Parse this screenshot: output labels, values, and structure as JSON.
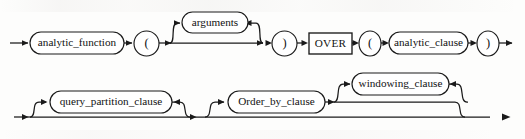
{
  "diagram": {
    "type": "railroad-syntax-diagram",
    "title": "analytic_function",
    "colors": {
      "background": "#fdfdfc",
      "stroke": "#1a1a1a",
      "node_fill": "#ffffff",
      "text": "#111111"
    },
    "rows": [
      {
        "id": "row-top",
        "nodes": [
          {
            "id": "analytic_function",
            "label": "analytic_function",
            "shape": "rounded-rect",
            "kind": "nonterminal",
            "x": 30,
            "y": 32,
            "w": 94,
            "h": 22
          },
          {
            "id": "open-paren-1",
            "label": "(",
            "shape": "circle",
            "kind": "terminal",
            "x": 134,
            "y": 31,
            "w": 25,
            "h": 25
          },
          {
            "id": "arguments",
            "label": "arguments",
            "shape": "rounded-rect",
            "kind": "nonterminal",
            "x": 182,
            "y": 12,
            "w": 66,
            "h": 21
          },
          {
            "id": "close-paren-1",
            "label": ")",
            "shape": "circle",
            "kind": "terminal",
            "x": 272,
            "y": 31,
            "w": 25,
            "h": 25
          },
          {
            "id": "over-keyword",
            "label": "OVER",
            "shape": "rect",
            "kind": "keyword",
            "x": 309,
            "y": 33,
            "w": 43,
            "h": 21
          },
          {
            "id": "open-paren-2",
            "label": "(",
            "shape": "circle",
            "kind": "terminal",
            "x": 359,
            "y": 31,
            "w": 22,
            "h": 25
          },
          {
            "id": "analytic_clause",
            "label": "analytic_clause",
            "shape": "rounded-rect",
            "kind": "nonterminal",
            "x": 389,
            "y": 32,
            "w": 79,
            "h": 22
          },
          {
            "id": "close-paren-2",
            "label": ")",
            "shape": "circle",
            "kind": "terminal",
            "x": 477,
            "y": 31,
            "w": 22,
            "h": 25
          }
        ]
      },
      {
        "id": "row-bottom",
        "nodes": [
          {
            "id": "query_partition_clause",
            "label": "query_partition_clause",
            "shape": "rounded-rect",
            "kind": "nonterminal",
            "x": 50,
            "y": 91,
            "w": 122,
            "h": 22
          },
          {
            "id": "Order_by_clause",
            "label": "Order_by_clause",
            "shape": "rounded-rect",
            "kind": "nonterminal",
            "x": 228,
            "y": 91,
            "w": 97,
            "h": 22
          },
          {
            "id": "windowing_clause",
            "label": "windowing_clause",
            "shape": "rounded-rect",
            "kind": "nonterminal",
            "x": 352,
            "y": 73,
            "w": 97,
            "h": 22
          }
        ]
      }
    ],
    "optional_paths": [
      {
        "for": "arguments",
        "description": "bypass line skipping arguments"
      },
      {
        "for": "query_partition_clause",
        "description": "bypass line skipping query_partition_clause"
      },
      {
        "for": "Order_by_clause",
        "description": "bypass line skipping Order_by_clause and windowing_clause"
      },
      {
        "for": "windowing_clause",
        "description": "bypass line skipping windowing_clause"
      }
    ],
    "entry_arrow": {
      "x": 10,
      "y": 43
    },
    "exit_arrow": {
      "x": 508,
      "y": 117
    }
  }
}
